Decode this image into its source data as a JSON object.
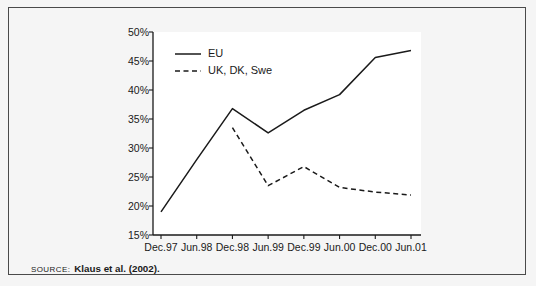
{
  "figure": {
    "source_label": "SOURCE:",
    "source_text": "Klaus et al. (2002)."
  },
  "colors": {
    "line": "#1a1a1a",
    "axis": "#1a1a1a",
    "plot_background": "#ffffff",
    "figure_background": "#f5f5f5",
    "frame_border": "#4a4a4a",
    "text": "#1a1a1a"
  },
  "chart_data": {
    "type": "line",
    "title": "",
    "xlabel": "",
    "ylabel": "",
    "categories": [
      "Dec.97",
      "Jun.98",
      "Dec.98",
      "Jun.99",
      "Dec.99",
      "Jun.00",
      "Dec.00",
      "Jun.01"
    ],
    "ylim": [
      15,
      50
    ],
    "yticks": [
      15,
      20,
      25,
      30,
      35,
      40,
      45,
      50
    ],
    "ytick_labels": [
      "15%",
      "20%",
      "25%",
      "30%",
      "35%",
      "40%",
      "45%",
      "50%"
    ],
    "grid": false,
    "legend_position": "top-left",
    "series": [
      {
        "name": "EU",
        "style": "solid",
        "values": [
          19.0,
          28.0,
          36.8,
          32.6,
          36.5,
          39.2,
          45.6,
          46.8
        ]
      },
      {
        "name": "UK, DK, Swe",
        "style": "dashed",
        "values": [
          null,
          null,
          33.5,
          23.5,
          26.8,
          23.2,
          22.4,
          21.9
        ]
      }
    ]
  }
}
